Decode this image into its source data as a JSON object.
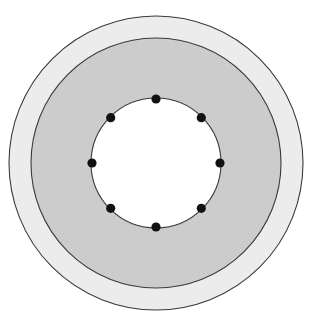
{
  "canvas": {
    "width": 313,
    "height": 324,
    "background": "#ffffff"
  },
  "figure": {
    "name": "brake-drum-front-view",
    "kind": "mechanical-part-drawing",
    "center": {
      "x": 156,
      "y": 163
    }
  },
  "colors": {
    "background": "#ffffff",
    "outer_rim_fill": "#ececec",
    "body_fill": "#cccccc",
    "bore_fill": "#ffffff",
    "outline_stroke": "#3a3a3a",
    "bolt_hole_fill": "#111111"
  },
  "circles": [
    {
      "name": "outer-rim-circle",
      "label": "Outer rim",
      "cx": 156,
      "cy": 163,
      "r": 147,
      "fill": "#ececec",
      "stroke": "#3a3a3a",
      "stroke_width": 1.1
    },
    {
      "name": "drum-body-circle",
      "label": "Drum body",
      "cx": 156,
      "cy": 163,
      "r": 125,
      "fill": "#cccccc",
      "stroke": "#3a3a3a",
      "stroke_width": 1.1
    },
    {
      "name": "center-bore-circle",
      "label": "Center bore",
      "cx": 156,
      "cy": 163,
      "r": 65,
      "fill": "#ffffff",
      "stroke": "#3a3a3a",
      "stroke_width": 1.1
    }
  ],
  "bolt_pattern": {
    "name": "bolt-circle",
    "count": 8,
    "bolt_circle_radius": 64,
    "hole_radius": 4.6,
    "start_angle_deg": -90,
    "step_angle_deg": 45,
    "holes": [
      {
        "name": "bolt-hole-1",
        "angle_deg": -90,
        "cx": 156.0,
        "cy": 99.0
      },
      {
        "name": "bolt-hole-2",
        "angle_deg": -45,
        "cx": 201.3,
        "cy": 117.7
      },
      {
        "name": "bolt-hole-3",
        "angle_deg": 0,
        "cx": 220.0,
        "cy": 163.0
      },
      {
        "name": "bolt-hole-4",
        "angle_deg": 45,
        "cx": 201.3,
        "cy": 208.3
      },
      {
        "name": "bolt-hole-5",
        "angle_deg": 90,
        "cx": 156.0,
        "cy": 227.0
      },
      {
        "name": "bolt-hole-6",
        "angle_deg": 135,
        "cx": 110.7,
        "cy": 208.3
      },
      {
        "name": "bolt-hole-7",
        "angle_deg": 180,
        "cx": 92.0,
        "cy": 163.0
      },
      {
        "name": "bolt-hole-8",
        "angle_deg": -135,
        "cx": 110.7,
        "cy": 117.7
      }
    ]
  }
}
